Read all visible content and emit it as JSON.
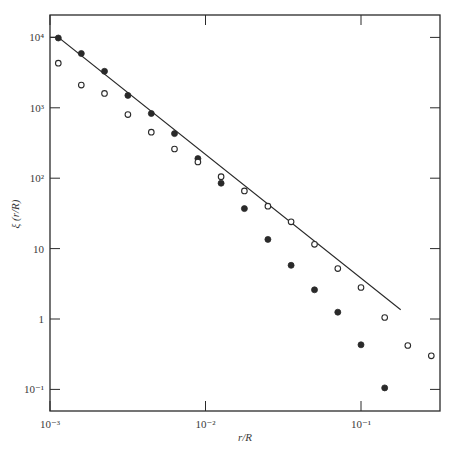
{
  "chart_data": {
    "type": "scatter",
    "title": "",
    "xlabel": "r/R",
    "ylabel": "ξ (r/R)",
    "xscale": "log",
    "yscale": "log",
    "xlim": [
      0.001,
      0.35
    ],
    "ylim": [
      0.05,
      20000
    ],
    "x_ticks": [
      {
        "value": 0.001,
        "label": "10⁻³"
      },
      {
        "value": 0.01,
        "label": "10⁻²"
      },
      {
        "value": 0.1,
        "label": "10⁻¹"
      }
    ],
    "y_ticks": [
      {
        "value": 0.1,
        "label": "10⁻¹"
      },
      {
        "value": 1,
        "label": "1"
      },
      {
        "value": 10,
        "label": "10"
      },
      {
        "value": 100,
        "label": "10²"
      },
      {
        "value": 1000,
        "label": "10³"
      },
      {
        "value": 10000,
        "label": "10⁴"
      }
    ],
    "grid": false,
    "legend": null,
    "series": [
      {
        "name": "filled",
        "marker": "filled-circle",
        "points": [
          [
            0.00113,
            9800
          ],
          [
            0.00159,
            5900
          ],
          [
            0.00224,
            3300
          ],
          [
            0.00317,
            1500
          ],
          [
            0.00448,
            830
          ],
          [
            0.00632,
            430
          ],
          [
            0.00893,
            190
          ],
          [
            0.0126,
            85
          ],
          [
            0.0178,
            37
          ],
          [
            0.0252,
            13.5
          ],
          [
            0.0355,
            5.8
          ],
          [
            0.0502,
            2.6
          ],
          [
            0.0709,
            1.25
          ],
          [
            0.1,
            0.43
          ],
          [
            0.142,
            0.105
          ]
        ]
      },
      {
        "name": "open",
        "marker": "open-circle",
        "points": [
          [
            0.00113,
            4300
          ],
          [
            0.00159,
            2100
          ],
          [
            0.00224,
            1600
          ],
          [
            0.00317,
            800
          ],
          [
            0.00448,
            450
          ],
          [
            0.00632,
            260
          ],
          [
            0.00893,
            170
          ],
          [
            0.0126,
            105
          ],
          [
            0.0178,
            66
          ],
          [
            0.0252,
            40
          ],
          [
            0.0355,
            24
          ],
          [
            0.0502,
            11.5
          ],
          [
            0.0709,
            5.2
          ],
          [
            0.1,
            2.8
          ],
          [
            0.142,
            1.05
          ],
          [
            0.2,
            0.42
          ],
          [
            0.283,
            0.3
          ]
        ]
      },
      {
        "name": "power-law fit",
        "marker": "line",
        "points": [
          [
            0.001,
            10000
          ],
          [
            0.00113,
            10000
          ],
          [
            0.18,
            1.35
          ]
        ]
      }
    ]
  },
  "plot": {
    "frame": {
      "left": 50,
      "right": 440,
      "top": 15,
      "bottom": 411
    },
    "x_decade_px": 155.5,
    "x_origin_px": 50,
    "y_decade_px": 70.4,
    "y_ref_px": 319,
    "colors": {
      "ink": "#2a2a2a",
      "background": "#ffffff"
    }
  }
}
